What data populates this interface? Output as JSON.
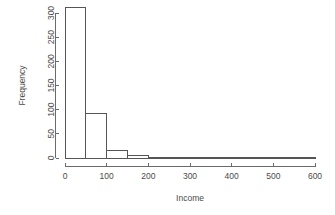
{
  "chart_data": {
    "type": "bar",
    "title": "",
    "subtitle": "",
    "xlabel": "Income",
    "ylabel": "Frequency",
    "xlim": [
      0,
      600
    ],
    "ylim": [
      0,
      312
    ],
    "grid": false,
    "legend": false,
    "bin_width": 50,
    "bin_edges": [
      0,
      50,
      100,
      150,
      200,
      250,
      300,
      350,
      400,
      450,
      500,
      550,
      600
    ],
    "categories": [
      "0-50",
      "50-100",
      "100-150",
      "150-200",
      "200-250",
      "250-300",
      "300-350",
      "350-400",
      "400-450",
      "450-500",
      "500-550",
      "550-600"
    ],
    "values": [
      312,
      93,
      16,
      5,
      0,
      1,
      1,
      2,
      0,
      0,
      0,
      1
    ],
    "xticks": [
      0,
      100,
      200,
      300,
      400,
      500,
      600
    ],
    "xticklabels": [
      "0",
      "100",
      "200",
      "300",
      "400",
      "500",
      "600"
    ],
    "yticks": [
      0,
      50,
      100,
      150,
      200,
      250,
      300
    ],
    "yticklabels": [
      "0",
      "50",
      "100",
      "150",
      "200",
      "250",
      "300"
    ],
    "style": {
      "bar_fill": "#ffffff",
      "bar_stroke": "#555555",
      "axis_color": "#6b6b6b",
      "text_color": "#4a4a4a",
      "background": "#ffffff"
    }
  }
}
